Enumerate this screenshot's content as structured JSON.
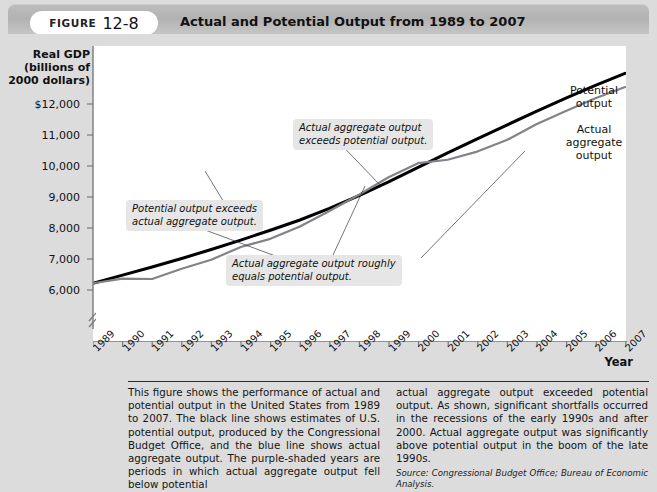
{
  "header": {
    "figure_word": "FIGURE",
    "figure_number": "12-8",
    "title": "Actual and Potential Output from 1989 to 2007"
  },
  "chart_data": {
    "type": "line",
    "title": "Actual and Potential Output from 1989 to 2007",
    "xlabel": "Year",
    "ylabel": "Real GDP\n(billions of\n2000 dollars)",
    "ylabel_line1": "Real GDP",
    "ylabel_line2": "(billions of",
    "ylabel_line3": "2000 dollars)",
    "grid": false,
    "axis_break": true,
    "ylim": [
      5500,
      12400
    ],
    "yticks": [
      6000,
      7000,
      8000,
      9000,
      10000,
      11000,
      12000
    ],
    "ytick_labels": [
      "6,000",
      "7,000",
      "8,000",
      "9,000",
      "10,000",
      "11,000",
      "$12,000"
    ],
    "categories": [
      1989,
      1990,
      1991,
      1992,
      1993,
      1994,
      1995,
      1996,
      1997,
      1998,
      1999,
      2000,
      2001,
      2002,
      2003,
      2004,
      2005,
      2006,
      2007
    ],
    "xtick_labels": [
      "1989",
      "1990",
      "1991",
      "1992",
      "1993",
      "1994",
      "1995",
      "1996",
      "1997",
      "1998",
      "1999",
      "2000",
      "2001",
      "2002",
      "2003",
      "2004",
      "2005",
      "2006",
      "2007"
    ],
    "series": [
      {
        "name": "Potential output",
        "color": "#000000",
        "width": 3.0,
        "values": [
          6850,
          7040,
          7230,
          7430,
          7640,
          7860,
          8090,
          8330,
          8600,
          8900,
          9220,
          9560,
          9900,
          10230,
          10550,
          10870,
          11180,
          11480,
          11760
        ]
      },
      {
        "name": "Actual aggregate output",
        "color": "#808488",
        "width": 2.2,
        "values": [
          6850,
          6960,
          6950,
          7190,
          7400,
          7700,
          7890,
          8180,
          8540,
          8920,
          9330,
          9660,
          9740,
          9930,
          10200,
          10570,
          10880,
          11180,
          11440
        ]
      }
    ],
    "series_labels": [
      {
        "name": "potential-output-label",
        "text": "Potential\noutput",
        "line1": "Potential",
        "line2": "output"
      },
      {
        "name": "actual-output-label",
        "text": "Actual\naggregate\noutput",
        "line1": "Actual",
        "line2": "aggregate",
        "line3": "output"
      }
    ],
    "annotations": [
      {
        "name": "potential-exceeds-actual",
        "line1": "Potential output exceeds",
        "line2": "actual aggregate output."
      },
      {
        "name": "actual-exceeds-potential",
        "line1": "Actual aggregate output",
        "line2": "exceeds potential output."
      },
      {
        "name": "actual-equals-potential",
        "line1": "Actual aggregate output roughly",
        "line2": "equals potential output."
      }
    ]
  },
  "caption": {
    "left": "This figure shows the performance of actual and potential output in the United States from 1989 to 2007. The black line shows estimates of U.S. potential output, produced by the Congressional Budget Office, and the blue line shows actual aggregate output. The purple-shaded years are periods in which actual aggregate output fell below potential",
    "right": "actual aggregate output exceeded potential output. As shown, significant shortfalls occurred in the recessions of the early 1990s and after 2000. Actual aggregate output was significantly above potential output in the boom of the late 1990s.",
    "source": "Source: Congressional Budget Office; Bureau of Economic Analysis."
  }
}
